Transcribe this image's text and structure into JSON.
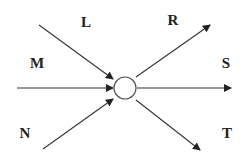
{
  "diagram": {
    "type": "flow-junction",
    "colors": {
      "line": "#333333",
      "node_stroke": "#555555",
      "text": "#222222",
      "background": "#ffffff"
    },
    "node": {
      "name": "junction",
      "cx": 125,
      "cy": 88,
      "r": 11
    },
    "inputs": [
      {
        "label": "L",
        "from": [
          39,
          25
        ],
        "to": [
          113,
          79
        ],
        "label_pos": [
          86,
          27
        ]
      },
      {
        "label": "M",
        "from": [
          17,
          88
        ],
        "to": [
          113,
          88
        ],
        "label_pos": [
          37,
          68
        ]
      },
      {
        "label": "N",
        "from": [
          43,
          149
        ],
        "to": [
          113,
          99
        ],
        "label_pos": [
          25,
          138
        ]
      }
    ],
    "outputs": [
      {
        "label": "R",
        "from": [
          136,
          77
        ],
        "to": [
          210,
          25
        ],
        "label_pos": [
          173,
          25
        ]
      },
      {
        "label": "S",
        "from": [
          137,
          88
        ],
        "to": [
          231,
          88
        ],
        "label_pos": [
          226,
          68
        ]
      },
      {
        "label": "T",
        "from": [
          136,
          100
        ],
        "to": [
          200,
          150
        ],
        "label_pos": [
          227,
          138
        ]
      }
    ]
  }
}
